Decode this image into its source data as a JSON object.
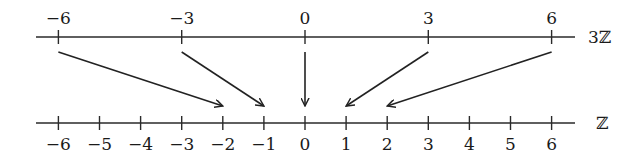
{
  "diagram": {
    "title": "",
    "top_axis": {
      "label": "3ℤ",
      "ticks": [
        {
          "value": -6,
          "label": "−6"
        },
        {
          "value": -3,
          "label": "−3"
        },
        {
          "value": 0,
          "label": "0"
        },
        {
          "value": 3,
          "label": "3"
        },
        {
          "value": 6,
          "label": "6"
        }
      ]
    },
    "bottom_axis": {
      "label": "ℤ",
      "ticks": [
        {
          "value": -6,
          "label": "−6"
        },
        {
          "value": -5,
          "label": "−5"
        },
        {
          "value": -4,
          "label": "−4"
        },
        {
          "value": -3,
          "label": "−3"
        },
        {
          "value": -2,
          "label": "−2"
        },
        {
          "value": -1,
          "label": "−1"
        },
        {
          "value": 0,
          "label": "0"
        },
        {
          "value": 1,
          "label": "1"
        },
        {
          "value": 2,
          "label": "2"
        },
        {
          "value": 3,
          "label": "3"
        },
        {
          "value": 4,
          "label": "4"
        },
        {
          "value": 5,
          "label": "5"
        },
        {
          "value": 6,
          "label": "6"
        }
      ]
    },
    "mappings": [
      {
        "from": -6,
        "to": -2
      },
      {
        "from": -3,
        "to": -1
      },
      {
        "from": 0,
        "to": 0
      },
      {
        "from": 3,
        "to": 1
      },
      {
        "from": 6,
        "to": 2
      }
    ],
    "colors": {
      "ink": "#222222",
      "background": "#ffffff"
    }
  }
}
